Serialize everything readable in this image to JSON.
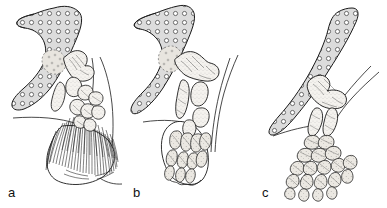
{
  "figure": {
    "caption_visible": false,
    "background_color": "#ffffff",
    "ink_color": "#1a1a1a",
    "cartilage_fill": "#dcdcdc",
    "bone_fill": "#f2f0ec",
    "panel_count": 3
  },
  "panels": [
    {
      "id": "a",
      "label": "a",
      "label_x": 8,
      "label_y": 197,
      "stage": "lobe-finned fish pectoral fin",
      "structures": [
        "scapulocoracoid",
        "humerus",
        "radius",
        "ulna",
        "proximal radials",
        "lepidotrichia fin rays",
        "body wall outline"
      ],
      "fin_ray_count": 46,
      "digit_count": 0
    },
    {
      "id": "b",
      "label": "b",
      "label_x": 133,
      "label_y": 197,
      "stage": "transitional limb with elongated radials",
      "structures": [
        "scapulocoracoid",
        "humerus",
        "radius",
        "ulna",
        "ulnare",
        "elongated distal radials",
        "reduced fin web",
        "body wall outline"
      ],
      "fin_ray_count": 0,
      "digit_count": 8
    },
    {
      "id": "c",
      "label": "c",
      "label_x": 262,
      "label_y": 197,
      "stage": "tetrapod limb with articulated digits",
      "structures": [
        "scapulocoracoid blade",
        "humerus",
        "radius",
        "ulna",
        "carpals",
        "metacarpals",
        "phalanges",
        "body wall outline"
      ],
      "fin_ray_count": 0,
      "digit_count": 5
    }
  ],
  "legend": {
    "cartilage_texture": "open circles on light gray",
    "bone_texture": "fine stipple with hatched shading"
  }
}
